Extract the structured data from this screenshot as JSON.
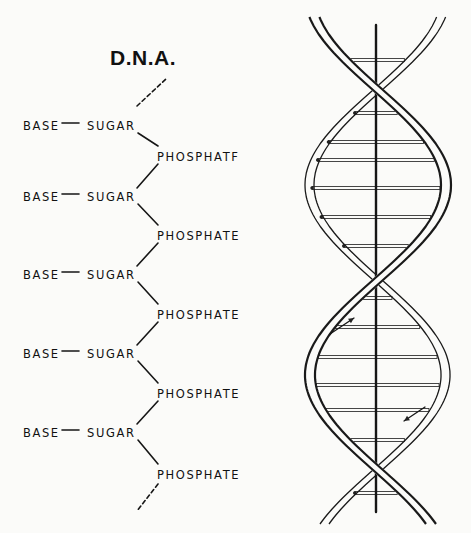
{
  "title": "D.N.A.",
  "chain": {
    "rows": [
      {
        "base": "BASE",
        "sugar": "SUGAR",
        "phosphate": "PHOSPHATF",
        "y": 119
      },
      {
        "base": "BASE",
        "sugar": "SUGAR",
        "phosphate": "PHOSPHATE",
        "y": 190
      },
      {
        "base": "BASE",
        "sugar": "SUGAR",
        "phosphate": "PHOSPHATE",
        "y": 268
      },
      {
        "base": "BASE",
        "sugar": "SUGAR",
        "phosphate": "PHOSPHATE",
        "y": 347
      },
      {
        "base": "BASE",
        "sugar": "SUGAR",
        "phosphate": "PHOSPHATE",
        "y": 426
      }
    ],
    "phosphate_y": [
      150,
      229,
      308,
      387,
      468
    ]
  },
  "helix": {
    "axis_x": 376,
    "axis_top": 25,
    "axis_bottom": 512,
    "center_x": 376,
    "amplitude": 68,
    "period": 380,
    "phase_y": 90,
    "strand_color": "#1a1a1a",
    "arrows": [
      {
        "direction": "up",
        "x1": 330,
        "y1": 334,
        "x2": 354,
        "y2": 318
      },
      {
        "direction": "down",
        "x1": 425,
        "y1": 407,
        "x2": 404,
        "y2": 421
      }
    ],
    "rungs_y": [
      60,
      88,
      113,
      142,
      160,
      188,
      217,
      246,
      273,
      298,
      327,
      357,
      385,
      410,
      440,
      465,
      493
    ]
  }
}
